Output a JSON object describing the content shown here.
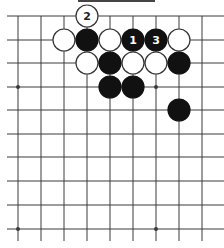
{
  "diagram": {
    "type": "go-board-fragment",
    "colors": {
      "background": "#ffffff",
      "grid_line": "#3a3a3a",
      "black_stone": "#111111",
      "white_stone_fill": "#ffffff",
      "white_stone_stroke": "#333333",
      "black_label": "#ffffff",
      "white_label": "#222222",
      "top_bar": "#444444"
    },
    "grid": {
      "columns_x": [
        18,
        41,
        64,
        87,
        110,
        133,
        156,
        179,
        202
      ],
      "rows_y": [
        16,
        40,
        63,
        87,
        110,
        134,
        157,
        181,
        205,
        229
      ],
      "line_left": 7,
      "line_right": 224,
      "line_top": 16,
      "line_bottom": 241
    },
    "top_bar": {
      "x1": 78,
      "x2": 155,
      "y": 1
    },
    "star_points": [
      {
        "col": 0,
        "row": 3
      },
      {
        "col": 6,
        "row": 3
      },
      {
        "col": 0,
        "row": 9
      },
      {
        "col": 6,
        "row": 9
      }
    ],
    "stones": [
      {
        "color": "white",
        "col": 3,
        "row": 0,
        "label": "2"
      },
      {
        "color": "white",
        "col": 2,
        "row": 1,
        "label": ""
      },
      {
        "color": "black",
        "col": 3,
        "row": 1,
        "label": ""
      },
      {
        "color": "white",
        "col": 4,
        "row": 1,
        "label": ""
      },
      {
        "color": "black",
        "col": 5,
        "row": 1,
        "label": "1"
      },
      {
        "color": "black",
        "col": 6,
        "row": 1,
        "label": "3"
      },
      {
        "color": "white",
        "col": 7,
        "row": 1,
        "label": ""
      },
      {
        "color": "white",
        "col": 3,
        "row": 2,
        "label": ""
      },
      {
        "color": "black",
        "col": 4,
        "row": 2,
        "label": ""
      },
      {
        "color": "white",
        "col": 5,
        "row": 2,
        "label": ""
      },
      {
        "color": "white",
        "col": 6,
        "row": 2,
        "label": ""
      },
      {
        "color": "black",
        "col": 7,
        "row": 2,
        "label": ""
      },
      {
        "color": "black",
        "col": 4,
        "row": 3,
        "label": ""
      },
      {
        "color": "black",
        "col": 5,
        "row": 3,
        "label": ""
      },
      {
        "color": "black",
        "col": 7,
        "row": 4,
        "label": ""
      }
    ],
    "stone_radius": 11
  }
}
